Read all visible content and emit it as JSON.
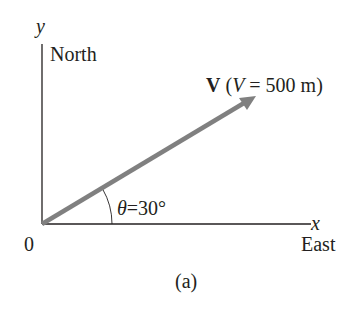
{
  "figure": {
    "caption": "(a)",
    "origin_label": "0",
    "y_axis": {
      "symbol": "y",
      "direction": "North"
    },
    "x_axis": {
      "symbol": "x",
      "direction": "East"
    },
    "vector": {
      "symbol": "V",
      "magnitude_symbol": "V",
      "magnitude_text": "= 500 m)",
      "open_paren": "(",
      "color": "#808080"
    },
    "angle": {
      "symbol": "θ",
      "value_text": "=30°"
    }
  }
}
